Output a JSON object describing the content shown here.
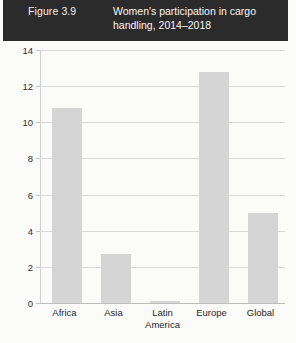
{
  "header": {
    "figure_number": "Figure 3.9",
    "title": "Women's participation in cargo handling, 2014–2018",
    "background_color": "#2b2b2b",
    "text_color": "#ffffff"
  },
  "chart_data": {
    "type": "bar",
    "title": "Women's participation in cargo handling, 2014–2018",
    "xlabel": "",
    "ylabel": "",
    "categories": [
      "Africa",
      "Asia",
      "Latin America",
      "Europe",
      "Global"
    ],
    "values": [
      10.8,
      2.7,
      0.1,
      12.8,
      5.0
    ],
    "series": [
      {
        "name": "Women's participation",
        "values": [
          10.8,
          2.7,
          0.1,
          12.8,
          5.0
        ]
      }
    ],
    "ylim": [
      0,
      14
    ],
    "yticks": [
      0,
      2,
      4,
      6,
      8,
      10,
      12,
      14
    ],
    "ytick_labels": [
      "0",
      "2",
      "4",
      "6",
      "8",
      "10",
      "12",
      "14"
    ],
    "grid": true,
    "grid_axis": "y",
    "legend": false,
    "legend_position": "none",
    "bar_color": "#d5d5d5",
    "grid_color": "#d9d9d9"
  }
}
